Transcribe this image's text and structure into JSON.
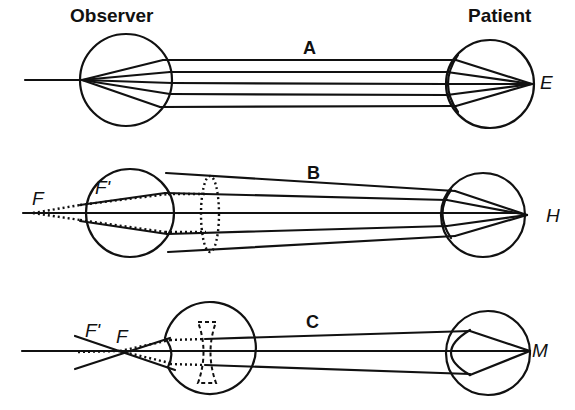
{
  "headers": {
    "observer": "Observer",
    "patient": "Patient"
  },
  "panels": [
    {
      "id": "A",
      "label": "A",
      "retina_label": "E",
      "condition": "emmetropia"
    },
    {
      "id": "B",
      "label": "B",
      "retina_label": "H",
      "condition": "hypermetropia",
      "lens": "convex",
      "observer_labels": [
        "F",
        "F'"
      ]
    },
    {
      "id": "C",
      "label": "C",
      "retina_label": "M",
      "condition": "myopia",
      "lens": "concave",
      "observer_labels": [
        "F'",
        "F"
      ]
    }
  ]
}
